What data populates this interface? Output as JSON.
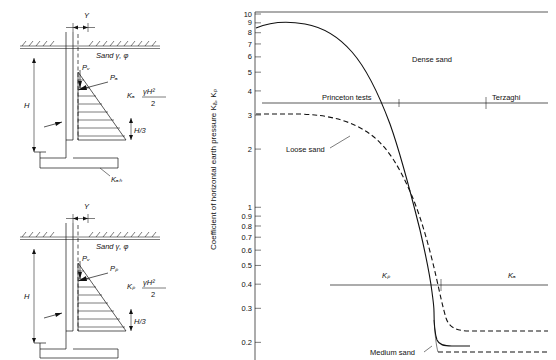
{
  "figure": {
    "left_diagrams": {
      "top": {
        "name": "active-earth-pressure-wall-diagram",
        "soil_label": "Sand γ, φ",
        "wall_height_label": "H",
        "resultant_label": "Pₐ",
        "vertical_component_label": "Pᵥ",
        "coefficient_label": "Kₐ",
        "pressure_expression": "γH²",
        "pressure_denominator": "2",
        "third_height_label": "H/3",
        "base_label": "Kₐₕ",
        "y_marker": "Y"
      },
      "bottom": {
        "name": "passive-earth-pressure-wall-diagram",
        "soil_label": "Sand γ, φ",
        "wall_height_label": "H",
        "resultant_label": "Pₚ",
        "vertical_component_label": "Pᵥ",
        "coefficient_label": "Kₚ",
        "pressure_expression": "γH²",
        "pressure_denominator": "2",
        "third_height_label": "H/3",
        "y_marker": "Y"
      }
    }
  },
  "chart_data": {
    "type": "line",
    "title": "",
    "ylabel": "Coefficient of horizontal earth pressure Kₐ, Kₚ",
    "xlabel": "",
    "yscale": "log",
    "ylim": [
      0.17,
      10
    ],
    "ytick_labels": [
      "10",
      "9",
      "8",
      "7",
      "6",
      "5",
      "4",
      "3",
      "2",
      "1",
      "0.9",
      "0.8",
      "0.7",
      "0.6",
      "0.5",
      "0.4",
      "0.3",
      "0.2"
    ],
    "ytick_values": [
      10,
      9,
      8,
      7,
      6,
      5,
      4,
      3,
      2,
      1,
      0.9,
      0.8,
      0.7,
      0.6,
      0.5,
      0.4,
      0.3,
      0.2
    ],
    "grid": false,
    "legend": "none",
    "annotations": [
      {
        "text": "Dense sand",
        "x": 0.6,
        "y": 6.0
      },
      {
        "text": "Princeton tests",
        "x": 0.2,
        "y": 3.4
      },
      {
        "text": "Terzaghi",
        "x": 0.9,
        "y": 3.4
      },
      {
        "text": "Loose sand",
        "x": 0.12,
        "y": 2.2
      },
      {
        "text": "Kₚ",
        "x": 0.42,
        "y": 0.46
      },
      {
        "text": "Kₐ",
        "x": 0.86,
        "y": 0.46
      },
      {
        "text": "Medium sand",
        "x": 0.62,
        "y": 0.185
      }
    ],
    "series": [
      {
        "name": "Dense sand (passive, upper branch)",
        "style": "solid",
        "description": "Starts near K=8.6 at far left, rises slightly then falls steeply toward the vertical asymptote near the wall-movement origin.",
        "points": [
          [
            0.0,
            8.6
          ],
          [
            0.08,
            8.9
          ],
          [
            0.18,
            8.85
          ],
          [
            0.3,
            8.5
          ],
          [
            0.42,
            7.9
          ],
          [
            0.52,
            7.0
          ],
          [
            0.6,
            6.0
          ],
          [
            0.66,
            5.0
          ],
          [
            0.7,
            4.2
          ],
          [
            0.735,
            3.4
          ],
          [
            0.757,
            2.6
          ],
          [
            0.772,
            2.0
          ],
          [
            0.782,
            1.5
          ],
          [
            0.79,
            1.1
          ],
          [
            0.795,
            0.85
          ],
          [
            0.8,
            0.6
          ],
          [
            0.802,
            0.45
          ],
          [
            0.804,
            0.35
          ],
          [
            0.806,
            0.3
          ]
        ]
      },
      {
        "name": "Loose sand (dashed)",
        "style": "dashed",
        "description": "Flat near K=3.05 at left, decreasing gradually then steeply down toward K≈0.28 on the right.",
        "points": [
          [
            0.0,
            3.05
          ],
          [
            0.12,
            3.05
          ],
          [
            0.24,
            3.0
          ],
          [
            0.36,
            2.85
          ],
          [
            0.46,
            2.6
          ],
          [
            0.55,
            2.3
          ],
          [
            0.62,
            2.0
          ],
          [
            0.68,
            1.7
          ],
          [
            0.72,
            1.45
          ],
          [
            0.755,
            1.2
          ],
          [
            0.775,
            1.0
          ],
          [
            0.79,
            0.82
          ],
          [
            0.8,
            0.68
          ],
          [
            0.808,
            0.55
          ],
          [
            0.814,
            0.45
          ],
          [
            0.818,
            0.38
          ],
          [
            0.822,
            0.33
          ],
          [
            0.828,
            0.3
          ],
          [
            0.85,
            0.288
          ],
          [
            0.92,
            0.283
          ],
          [
            1.0,
            0.282
          ]
        ]
      },
      {
        "name": "Medium sand (dashed, lower right)",
        "style": "dashed",
        "description": "Low horizontal dashed branch at K≈0.205 extending to the right edge.",
        "points": [
          [
            0.8,
            0.205
          ],
          [
            0.88,
            0.205
          ],
          [
            1.0,
            0.205
          ]
        ]
      },
      {
        "name": "Dense sand active branch (solid, lower right)",
        "style": "solid",
        "description": "Steep solid drop joining a short horizontal run near K≈0.23.",
        "points": [
          [
            0.806,
            0.3
          ],
          [
            0.81,
            0.26
          ],
          [
            0.815,
            0.235
          ],
          [
            0.84,
            0.232
          ],
          [
            0.9,
            0.232
          ]
        ]
      },
      {
        "name": "Princeton tests reference line",
        "style": "solid-thin",
        "description": "Horizontal line at K ≈ 3.25 spanning the plot width.",
        "points": [
          [
            0.02,
            3.25
          ],
          [
            1.0,
            3.25
          ]
        ]
      },
      {
        "name": "Kp / Ka divider line",
        "style": "solid-thin",
        "description": "Horizontal line at K ≈ 0.44 spanning the plot width.",
        "points": [
          [
            0.26,
            0.44
          ],
          [
            1.0,
            0.44
          ]
        ]
      }
    ]
  }
}
